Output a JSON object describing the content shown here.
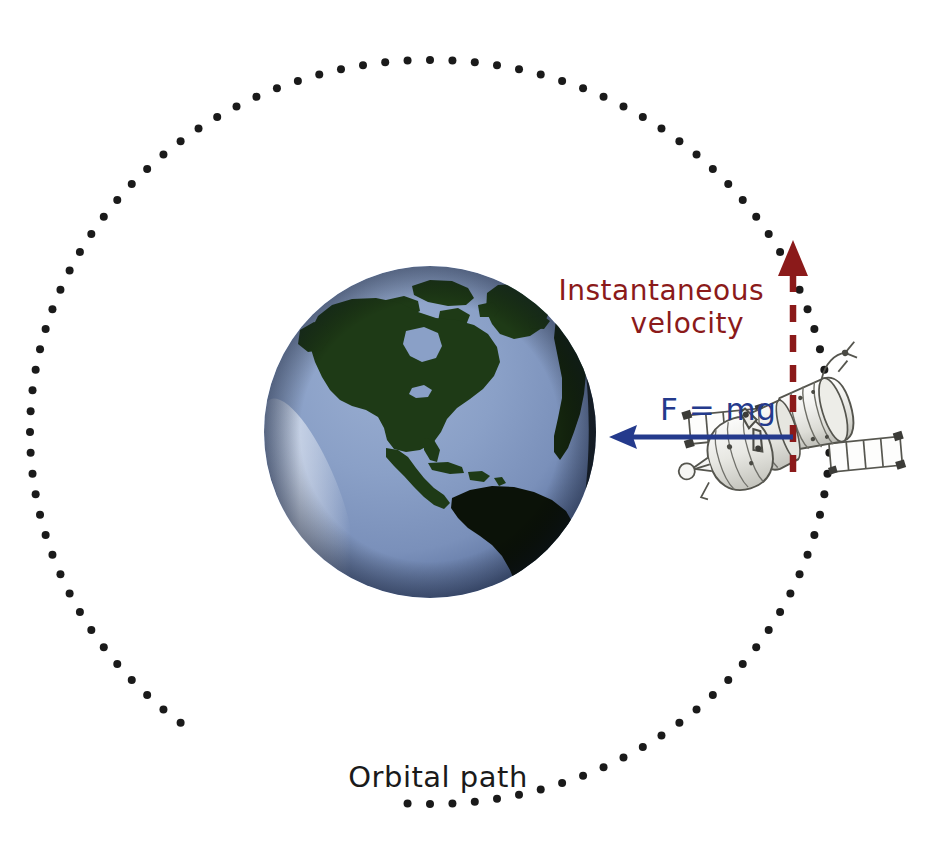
{
  "figure": {
    "background_color": "#ffffff",
    "width": 945,
    "height": 847
  },
  "labels": {
    "velocity_line1": "Instantaneous",
    "velocity_line2": "velocity",
    "force": "F = mg",
    "orbit": "Orbital path"
  },
  "colors": {
    "velocity_red": "#8B1A1A",
    "force_blue": "#243A8C",
    "orbit_black": "#1A1A1A",
    "ocean_light": "#8FA4C8",
    "ocean_mid": "#7D93BC",
    "ocean_dark": "#4F6590",
    "land_green": "#1E3A16",
    "land_dark": "#0B1208",
    "satellite_body": "#F2F2F0",
    "satellite_outline": "#5A5A55",
    "panel_fill": "#FCFCFC"
  },
  "orbit": {
    "center_x": 430,
    "center_y": 432,
    "radius_x": 400,
    "radius_y": 372,
    "dot_count": 112,
    "dot_radius": 4.0,
    "style": "dotted-ellipse"
  },
  "earth": {
    "center_x": 430,
    "center_y": 432,
    "radius": 166,
    "continents": "North and South America, Greenland, western Africa"
  },
  "satellite": {
    "center_x": 786,
    "center_y": 440,
    "type": "soyuz-spacecraft",
    "rotation_deg": -18
  },
  "velocity_arrow": {
    "x": 793,
    "y_tip": 243,
    "y_base": 470,
    "direction": "up",
    "dash": "dashed",
    "color": "#8B1A1A"
  },
  "force_arrow": {
    "x_tip": 613,
    "x_base": 793,
    "y": 437,
    "direction": "left",
    "color": "#243A8C"
  },
  "chart_data": {
    "type": "diagram",
    "annotations": [
      {
        "text": "Instantaneous velocity",
        "x": 700,
        "y": 295,
        "color": "#8B1A1A",
        "points_to": "tangent-up"
      },
      {
        "text": "F = mg",
        "x": 700,
        "y": 410,
        "color": "#243A8C",
        "points_to": "earth-center"
      },
      {
        "text": "Orbital path",
        "x": 435,
        "y": 775,
        "color": "#1A1A1A",
        "points_to": "dotted-ellipse"
      }
    ]
  }
}
